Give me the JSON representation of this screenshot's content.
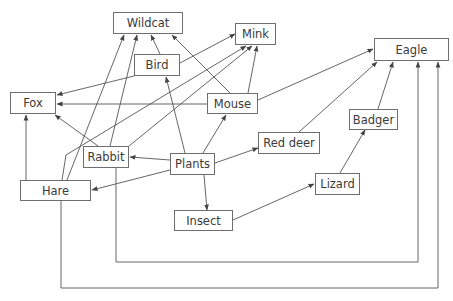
{
  "diagram": {
    "type": "food-web",
    "line_color": "#555555",
    "box_border_color": "#6e6e6e",
    "text_color": "#3a3a3a",
    "nodes": [
      {
        "id": "wildcat",
        "label": "Wildcat",
        "x": 113,
        "y": 12,
        "w": 70,
        "h": 22
      },
      {
        "id": "mink",
        "label": "Mink",
        "x": 235,
        "y": 23,
        "w": 41,
        "h": 22
      },
      {
        "id": "eagle",
        "label": "Eagle",
        "x": 374,
        "y": 38,
        "w": 75,
        "h": 23
      },
      {
        "id": "bird",
        "label": "Bird",
        "x": 134,
        "y": 54,
        "w": 46,
        "h": 22
      },
      {
        "id": "fox",
        "label": "Fox",
        "x": 10,
        "y": 92,
        "w": 46,
        "h": 22
      },
      {
        "id": "mouse",
        "label": "Mouse",
        "x": 207,
        "y": 93,
        "w": 51,
        "h": 21
      },
      {
        "id": "badger",
        "label": "Badger",
        "x": 349,
        "y": 109,
        "w": 49,
        "h": 21
      },
      {
        "id": "red_deer",
        "label": "Red deer",
        "x": 258,
        "y": 132,
        "w": 62,
        "h": 22
      },
      {
        "id": "rabbit",
        "label": "Rabbit",
        "x": 83,
        "y": 146,
        "w": 46,
        "h": 22
      },
      {
        "id": "plants",
        "label": "Plants",
        "x": 170,
        "y": 153,
        "w": 45,
        "h": 22
      },
      {
        "id": "lizard",
        "label": "Lizard",
        "x": 315,
        "y": 173,
        "w": 45,
        "h": 22
      },
      {
        "id": "hare",
        "label": "Hare",
        "x": 20,
        "y": 180,
        "w": 71,
        "h": 21
      },
      {
        "id": "insect",
        "label": "Insect",
        "x": 174,
        "y": 210,
        "w": 59,
        "h": 21
      }
    ],
    "edges": [
      {
        "from": "plants",
        "to": "rabbit",
        "points": [
          [
            170,
            160
          ],
          [
            130,
            157
          ]
        ]
      },
      {
        "from": "plants",
        "to": "hare",
        "points": [
          [
            170,
            170
          ],
          [
            92,
            190
          ]
        ]
      },
      {
        "from": "plants",
        "to": "insect",
        "points": [
          [
            204,
            175
          ],
          [
            207,
            210
          ]
        ]
      },
      {
        "from": "plants",
        "to": "red_deer",
        "points": [
          [
            215,
            163
          ],
          [
            258,
            148
          ]
        ]
      },
      {
        "from": "plants",
        "to": "mouse",
        "points": [
          [
            203,
            153
          ],
          [
            226,
            115
          ]
        ]
      },
      {
        "from": "plants",
        "to": "bird",
        "points": [
          [
            185,
            153
          ],
          [
            166,
            77
          ]
        ]
      },
      {
        "from": "insect",
        "to": "lizard",
        "points": [
          [
            233,
            220
          ],
          [
            314,
            184
          ]
        ]
      },
      {
        "from": "lizard",
        "to": "badger",
        "points": [
          [
            340,
            173
          ],
          [
            365,
            130
          ]
        ]
      },
      {
        "from": "badger",
        "to": "eagle",
        "points": [
          [
            378,
            109
          ],
          [
            393,
            62
          ]
        ]
      },
      {
        "from": "red_deer",
        "to": "eagle",
        "points": [
          [
            299,
            132
          ],
          [
            377,
            62
          ]
        ]
      },
      {
        "from": "mouse",
        "to": "eagle",
        "points": [
          [
            258,
            100
          ],
          [
            373,
            49
          ]
        ]
      },
      {
        "from": "mouse",
        "to": "mink",
        "points": [
          [
            248,
            93
          ],
          [
            257,
            46
          ]
        ]
      },
      {
        "from": "mouse",
        "to": "wildcat",
        "points": [
          [
            230,
            93
          ],
          [
            172,
            35
          ]
        ]
      },
      {
        "from": "mouse",
        "to": "fox",
        "points": [
          [
            207,
            104
          ],
          [
            57,
            104
          ]
        ]
      },
      {
        "from": "bird",
        "to": "wildcat",
        "points": [
          [
            160,
            54
          ],
          [
            151,
            35
          ]
        ]
      },
      {
        "from": "bird",
        "to": "mink",
        "points": [
          [
            180,
            63
          ],
          [
            235,
            34
          ]
        ]
      },
      {
        "from": "bird",
        "to": "fox",
        "points": [
          [
            134,
            76
          ],
          [
            57,
            95
          ]
        ]
      },
      {
        "from": "rabbit",
        "to": "fox",
        "points": [
          [
            98,
            146
          ],
          [
            55,
            115
          ]
        ]
      },
      {
        "from": "rabbit",
        "to": "wildcat",
        "points": [
          [
            110,
            146
          ],
          [
            137,
            35
          ]
        ]
      },
      {
        "from": "rabbit",
        "to": "mink",
        "points": [
          [
            129,
            146
          ],
          [
            252,
            46
          ]
        ]
      },
      {
        "from": "rabbit",
        "to": "eagle",
        "points": [
          [
            116,
            168
          ],
          [
            116,
            262
          ],
          [
            418,
            262
          ],
          [
            418,
            62
          ]
        ]
      },
      {
        "from": "hare",
        "to": "fox",
        "points": [
          [
            26,
            180
          ],
          [
            26,
            115
          ]
        ]
      },
      {
        "from": "hare",
        "to": "wildcat",
        "points": [
          [
            67,
            180
          ],
          [
            124,
            35
          ]
        ]
      },
      {
        "from": "hare",
        "to": "mink",
        "points": [
          [
            62,
            180
          ],
          [
            66,
            155
          ],
          [
            246,
            46
          ]
        ]
      },
      {
        "from": "hare",
        "to": "eagle",
        "points": [
          [
            61,
            201
          ],
          [
            61,
            288
          ],
          [
            438,
            288
          ],
          [
            438,
            62
          ]
        ]
      }
    ]
  }
}
